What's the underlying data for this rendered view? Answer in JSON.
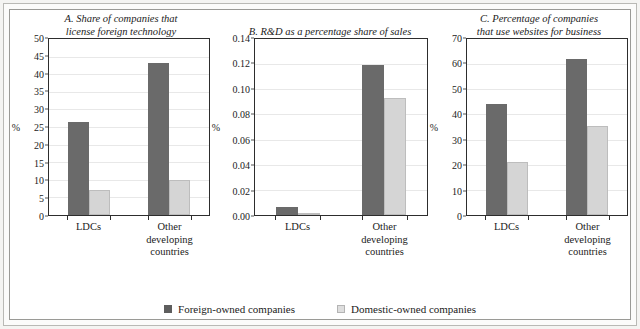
{
  "legend": {
    "items": [
      {
        "label": "Foreign-owned companies",
        "key": "foreign",
        "color": "#5e5e5e"
      },
      {
        "label": "Domestic-owned companies",
        "key": "domestic",
        "color": "#dedede"
      }
    ]
  },
  "colors": {
    "foreign_bar": "#6a6a6a",
    "domestic_bar": "#d5d5d5",
    "axis": "#2d2d2d",
    "gridline": "#e8e8e8",
    "frame": "#9a9a96",
    "page_background": "#f4f4f2"
  },
  "chart_data": [
    {
      "type": "bar",
      "panel": "A",
      "title": "A. Share of companies that license foreign technology",
      "title_lines": [
        "A. Share of companies that",
        "license foreign technology"
      ],
      "xlabel": "",
      "ylabel": "%",
      "ylim": [
        0,
        50
      ],
      "yticks": [
        0,
        5,
        10,
        15,
        20,
        25,
        30,
        35,
        40,
        45,
        50
      ],
      "ytick_labels": [
        "0",
        "5",
        "10",
        "15",
        "20",
        "25",
        "30",
        "35",
        "40",
        "45",
        "50"
      ],
      "grid": true,
      "legend_position": "below-figure",
      "categories": [
        "LDCs",
        "Other developing countries"
      ],
      "category_label_lines": [
        [
          "LDCs"
        ],
        [
          "Other",
          "developing",
          "countries"
        ]
      ],
      "series": [
        {
          "name": "Foreign-owned companies",
          "values": [
            26.3,
            43.2
          ]
        },
        {
          "name": "Domestic-owned companies",
          "values": [
            7.0,
            10.0
          ]
        }
      ]
    },
    {
      "type": "bar",
      "panel": "B",
      "title": "B. R&D as a percentage share of sales",
      "title_lines": [
        "B. R&D as a percentage share of sales"
      ],
      "xlabel": "",
      "ylabel": "%",
      "ylim": [
        0,
        0.14
      ],
      "yticks": [
        0,
        0.02,
        0.04,
        0.06,
        0.08,
        0.1,
        0.12,
        0.14
      ],
      "ytick_labels": [
        "0.00",
        "0.02",
        "0.04",
        "0.06",
        "0.08",
        "0.10",
        "0.12",
        "0.14"
      ],
      "grid": true,
      "legend_position": "below-figure",
      "categories": [
        "LDCs",
        "Other developing countries"
      ],
      "category_label_lines": [
        [
          "LDCs"
        ],
        [
          "Other",
          "developing",
          "countries"
        ]
      ],
      "series": [
        {
          "name": "Foreign-owned companies",
          "values": [
            0.006,
            0.119
          ]
        },
        {
          "name": "Domestic-owned companies",
          "values": [
            0.002,
            0.093
          ]
        }
      ]
    },
    {
      "type": "bar",
      "panel": "C",
      "title": "C. Percentage of companies that use websites for business",
      "title_lines": [
        "C. Percentage of companies",
        "that use websites for business"
      ],
      "xlabel": "",
      "ylabel": "%",
      "ylim": [
        0,
        70
      ],
      "yticks": [
        0,
        10,
        20,
        30,
        40,
        50,
        60,
        70
      ],
      "ytick_labels": [
        "0",
        "10",
        "20",
        "30",
        "40",
        "50",
        "60",
        "70"
      ],
      "grid": true,
      "legend_position": "below-figure",
      "categories": [
        "LDCs",
        "Other developing countries"
      ],
      "category_label_lines": [
        [
          "LDCs"
        ],
        [
          "Other",
          "developing",
          "countries"
        ]
      ],
      "series": [
        {
          "name": "Foreign-owned companies",
          "values": [
            44.3,
            62.2
          ]
        },
        {
          "name": "Domestic-owned companies",
          "values": [
            21.2,
            35.5
          ]
        }
      ]
    }
  ]
}
